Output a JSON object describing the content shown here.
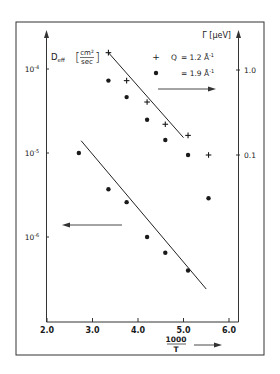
{
  "chart_data": {
    "type": "scatter",
    "title": "",
    "xlabel": "1000 / T",
    "xlabel_num": "1000",
    "xlabel_den": "T",
    "ylabel_left": "D_eff [cm²/sec]",
    "ylabel_left_main": "D",
    "ylabel_left_sub": "eff",
    "ylabel_left_unit_num": "cm²",
    "ylabel_left_unit_den": "sec",
    "ylabel_right": "Γ [μeV]",
    "xlim": [
      2.0,
      6.0
    ],
    "x_ticks": [
      "2.0",
      "3.0",
      "4.0",
      "5.0",
      "6.0"
    ],
    "x_tick_values": [
      2.0,
      3.0,
      4.0,
      5.0,
      6.0
    ],
    "y_left_scale": "log",
    "y_left_ticks": [
      {
        "value": 0.0001,
        "base": "10",
        "exp": "-4"
      },
      {
        "value": 1e-05,
        "base": "10",
        "exp": "-5"
      },
      {
        "value": 1e-06,
        "base": "10",
        "exp": "-6"
      }
    ],
    "y_right_scale": "log",
    "y_right_ticks": [
      {
        "value": 1.0,
        "label": "1.0"
      },
      {
        "value": 0.1,
        "label": "0.1"
      }
    ],
    "grid": false,
    "legend": {
      "position": "upper right",
      "entries": [
        {
          "marker": "+",
          "label": "Q = 1.2 Å⁻¹",
          "prefix": "Q",
          "text": "= 1.2 Å",
          "sup": "-1"
        },
        {
          "marker": "●",
          "label": "= 1.9 Å⁻¹",
          "prefix": "",
          "text": "= 1.9 Å",
          "sup": "-1"
        }
      ]
    },
    "annotations": [
      {
        "type": "arrow",
        "direction": "right",
        "meaning": "upper data refer to right axis (Γ)"
      },
      {
        "type": "arrow",
        "direction": "left",
        "meaning": "lower data refer to left axis (D_eff)"
      },
      {
        "type": "arrow",
        "direction": "right",
        "meaning": "x-axis direction 1000/T"
      }
    ],
    "series": [
      {
        "name": "Γ, Q = 1.2 Å⁻¹",
        "axis": "right",
        "marker": "cross",
        "x": [
          3.35,
          3.75,
          4.2,
          4.6,
          5.1,
          5.55
        ],
        "y": [
          1.6,
          0.75,
          0.42,
          0.23,
          0.17,
          0.1
        ]
      },
      {
        "name": "Γ, Q = 1.9 Å⁻¹",
        "axis": "right",
        "marker": "dot",
        "x": [
          3.35,
          3.75,
          4.2,
          4.6,
          5.1,
          5.55
        ],
        "y": [
          0.75,
          0.48,
          0.26,
          0.15,
          0.1,
          0.031
        ]
      },
      {
        "name": "D_eff",
        "axis": "left",
        "marker": "dot",
        "x": [
          2.7,
          3.35,
          3.75,
          4.2,
          4.6,
          5.1
        ],
        "y": [
          1e-05,
          3.7e-06,
          2.6e-06,
          1e-06,
          6.5e-07,
          4e-07
        ]
      }
    ],
    "fit_lines": [
      {
        "name": "Γ fit (Q = 1.2)",
        "axis": "right",
        "x": [
          3.35,
          5.0
        ],
        "y": [
          1.6,
          0.16
        ]
      },
      {
        "name": "D_eff fit",
        "axis": "left",
        "x": [
          2.75,
          5.5
        ],
        "y": [
          1.4e-05,
          2.4e-07
        ]
      }
    ]
  }
}
